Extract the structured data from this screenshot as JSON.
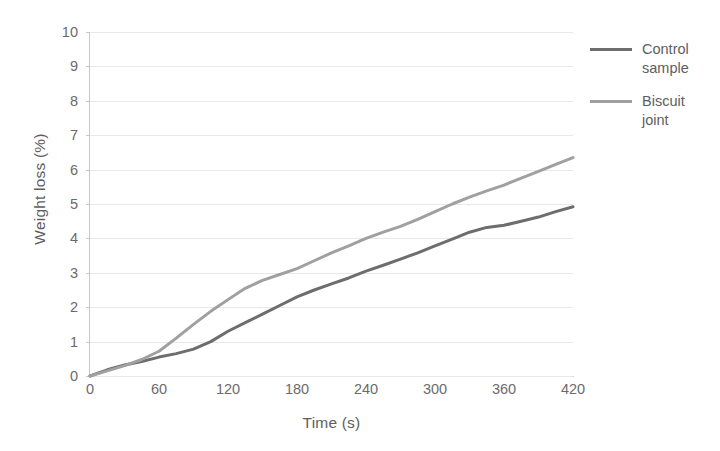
{
  "chart_data": {
    "type": "line",
    "title": "",
    "xlabel": "Time (s)",
    "ylabel": "Weight loss (%)",
    "xlim": [
      0,
      420
    ],
    "ylim": [
      0,
      10
    ],
    "xticks": [
      0,
      60,
      120,
      180,
      240,
      300,
      360,
      420
    ],
    "yticks": [
      0,
      1,
      2,
      3,
      4,
      5,
      6,
      7,
      8,
      9,
      10
    ],
    "grid": "horizontal",
    "legend_position": "right",
    "x": [
      0,
      15,
      30,
      45,
      60,
      75,
      90,
      105,
      120,
      135,
      150,
      165,
      180,
      195,
      210,
      225,
      240,
      255,
      270,
      285,
      300,
      315,
      330,
      345,
      360,
      375,
      390,
      405,
      420
    ],
    "series": [
      {
        "name": "Control sample",
        "color": "#6d6d6d",
        "values": [
          0.0,
          0.18,
          0.32,
          0.42,
          0.55,
          0.65,
          0.78,
          1.0,
          1.3,
          1.55,
          1.8,
          2.05,
          2.3,
          2.5,
          2.68,
          2.85,
          3.05,
          3.22,
          3.4,
          3.58,
          3.78,
          3.98,
          4.18,
          4.32,
          4.38,
          4.5,
          4.62,
          4.78,
          4.92
        ]
      },
      {
        "name": "Biscuit joint",
        "color": "#a0a0a0",
        "values": [
          0.0,
          0.15,
          0.3,
          0.48,
          0.72,
          1.1,
          1.5,
          1.88,
          2.22,
          2.55,
          2.78,
          2.95,
          3.12,
          3.35,
          3.58,
          3.78,
          4.0,
          4.18,
          4.35,
          4.55,
          4.78,
          5.0,
          5.2,
          5.38,
          5.55,
          5.75,
          5.95,
          6.15,
          6.35
        ]
      }
    ]
  },
  "axes": {
    "y_title": "Weight loss (%)",
    "x_title": "Time (s)",
    "y_tick_labels": [
      "10",
      "9",
      "8",
      "7",
      "6",
      "5",
      "4",
      "3",
      "2",
      "1",
      "0"
    ],
    "x_tick_labels": [
      "0",
      "60",
      "120",
      "180",
      "240",
      "300",
      "360",
      "420"
    ]
  },
  "legend": {
    "entries": [
      {
        "label": "Control sample",
        "color": "#6d6d6d"
      },
      {
        "label": "Biscuit joint",
        "color": "#a0a0a0"
      }
    ]
  }
}
